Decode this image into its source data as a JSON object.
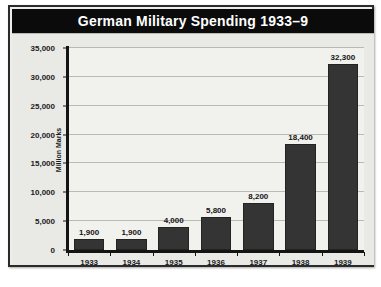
{
  "chart_data": {
    "type": "bar",
    "title": "German Military Spending 1933–9",
    "xlabel": "",
    "ylabel": "Million Marks",
    "categories": [
      "1933",
      "1934",
      "1935",
      "1936",
      "1937",
      "1938",
      "1939"
    ],
    "values": [
      1900,
      1900,
      4000,
      5800,
      8200,
      18400,
      32300
    ],
    "value_labels": [
      "1,900",
      "1,900",
      "4,000",
      "5,800",
      "8,200",
      "18,400",
      "32,300"
    ],
    "ylim": [
      0,
      35000
    ],
    "ytick_values": [
      0,
      5000,
      10000,
      15000,
      20000,
      25000,
      30000,
      35000
    ],
    "ytick_labels": [
      "0",
      "5,000",
      "10,000",
      "15,000",
      "20,000",
      "25,000",
      "30,000",
      "35,000"
    ],
    "grid": true,
    "legend": null,
    "bar_color": "#343434",
    "title_bar_color": "#0b0b0b",
    "title_text_color": "#ffffff",
    "plot_background": "#f1f1ee",
    "gridline_color": "#b9b9b5",
    "axis_color": "#141414"
  }
}
